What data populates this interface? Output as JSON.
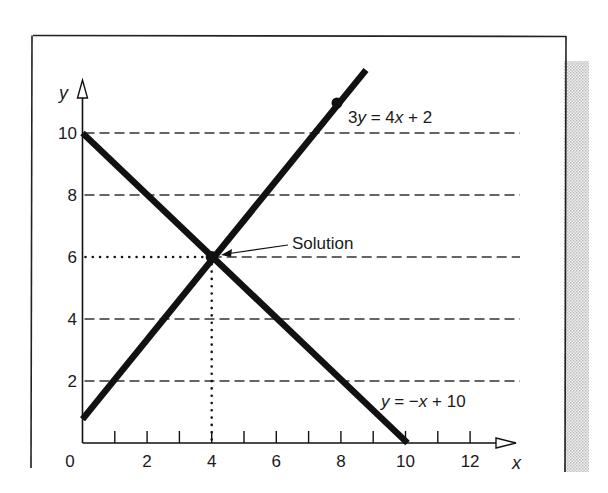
{
  "chart_data": {
    "type": "line",
    "title": "",
    "xlabel": "x",
    "ylabel": "y",
    "xlim": [
      0,
      13
    ],
    "ylim": [
      0,
      11
    ],
    "x_ticks": [
      0,
      1,
      2,
      3,
      4,
      5,
      6,
      7,
      8,
      9,
      10,
      11,
      12
    ],
    "x_tick_labels": [
      "0",
      "2",
      "4",
      "6",
      "8",
      "10",
      "12"
    ],
    "x_tick_label_values": [
      0,
      2,
      4,
      6,
      8,
      10,
      12
    ],
    "y_tick_labels": [
      "2",
      "4",
      "6",
      "8",
      "10"
    ],
    "y_tick_label_values": [
      2,
      4,
      6,
      8,
      10
    ],
    "grid": {
      "horizontal_dashed_at": [
        2,
        4,
        6,
        8,
        10
      ]
    },
    "series": [
      {
        "name": "3y = 4x + 2",
        "label_parts": [
          [
            "3",
            false
          ],
          [
            "y",
            true
          ],
          [
            " = 4",
            false
          ],
          [
            "x",
            true
          ],
          [
            " + 2",
            false
          ]
        ],
        "equation": "y = (4x + 2) / 3",
        "x": [
          0,
          8.8
        ],
        "y": [
          0.67,
          12.4
        ],
        "marker_point": [
          7.8,
          11.0
        ]
      },
      {
        "name": "y = −x + 10",
        "label_parts": [
          [
            "y",
            true
          ],
          [
            " = −",
            false
          ],
          [
            "x",
            true
          ],
          [
            " + 10",
            false
          ]
        ],
        "equation": "y = -x + 10",
        "x": [
          0,
          10
        ],
        "y": [
          10,
          0
        ]
      }
    ],
    "annotations": [
      {
        "text": "Solution",
        "point": [
          4,
          6
        ],
        "arrow": true
      }
    ],
    "solution_point": [
      4,
      6
    ],
    "guide_lines": {
      "vertical_dotted_at_x": 4,
      "horizontal_dotted_at_y": 6
    }
  },
  "labels": {
    "x_axis": "x",
    "y_axis": "y",
    "solution": "Solution",
    "line1": "3y = 4x + 2",
    "line2": "y = −x + 10"
  },
  "colors": {
    "ink": "#1a1a1a",
    "line": "#111111",
    "dash": "#333333",
    "frame": "#222222",
    "shade": "#d9d9d9"
  }
}
